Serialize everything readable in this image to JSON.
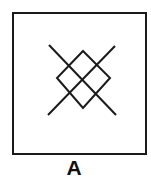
{
  "figure": {
    "label": "A",
    "stroke_color": "#1a1a1a",
    "background": "#ffffff",
    "shapes": [
      "outer-square",
      "x-cross",
      "diamond"
    ]
  }
}
